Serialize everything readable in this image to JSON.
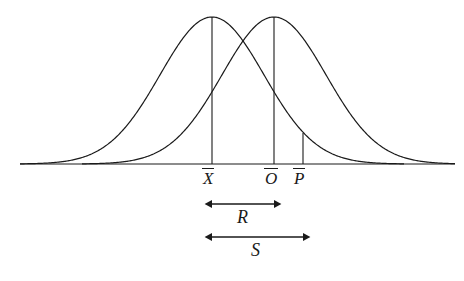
{
  "figure": {
    "background_color": "#ffffff",
    "stroke_color": "#1a1a1a"
  },
  "axis": {
    "baseline_label": "",
    "x_start": 20,
    "x_end": 455,
    "y": 164
  },
  "markers": [
    {
      "id": "x-bar",
      "letter": "X",
      "overbar": true,
      "x": 212,
      "top_y": 17,
      "label_x": 203,
      "label_y": 168
    },
    {
      "id": "o-bar",
      "letter": "O",
      "overbar": true,
      "x": 274,
      "top_y": 17,
      "label_x": 265,
      "label_y": 168
    },
    {
      "id": "p-bar",
      "letter": "P",
      "overbar": true,
      "x": 303,
      "top_y": 133,
      "label_x": 294,
      "label_y": 168
    }
  ],
  "dimensions": [
    {
      "id": "R",
      "label": "R",
      "from": "x-bar",
      "to": "o-bar",
      "x1": 212,
      "x2": 274,
      "y": 204,
      "label_x": 237,
      "label_y": 208
    },
    {
      "id": "S",
      "label": "S",
      "from": "x-bar",
      "to": "p-bar",
      "x1": 212,
      "x2": 303,
      "y": 237,
      "label_x": 251,
      "label_y": 241
    }
  ],
  "curves": [
    {
      "id": "left-curve",
      "mean_x": 212,
      "peak_y": 17,
      "sigma_px": 52,
      "x_from": 20,
      "x_to": 404
    },
    {
      "id": "right-curve",
      "mean_x": 274,
      "peak_y": 17,
      "sigma_px": 52,
      "x_from": 82,
      "x_to": 455
    }
  ],
  "chart_data": {
    "type": "line",
    "title": "",
    "xlabel": "",
    "ylabel": "",
    "grid": false,
    "legend": "none",
    "annotations": [
      "X̄",
      "Ō",
      "P̄",
      "R",
      "S"
    ],
    "series": [
      {
        "name": "left normal curve",
        "mean": 212,
        "sigma": 52,
        "peak_height": 147
      },
      {
        "name": "right normal curve",
        "mean": 274,
        "sigma": 52,
        "peak_height": 147
      }
    ],
    "verticals": [
      {
        "label": "X̄",
        "x": 212,
        "height": 147
      },
      {
        "label": "Ō",
        "x": 274,
        "height": 147
      },
      {
        "label": "P̄",
        "x": 303,
        "height": 31
      }
    ],
    "spans": [
      {
        "label": "R",
        "from": 212,
        "to": 274
      },
      {
        "label": "S",
        "from": 212,
        "to": 303
      }
    ]
  }
}
